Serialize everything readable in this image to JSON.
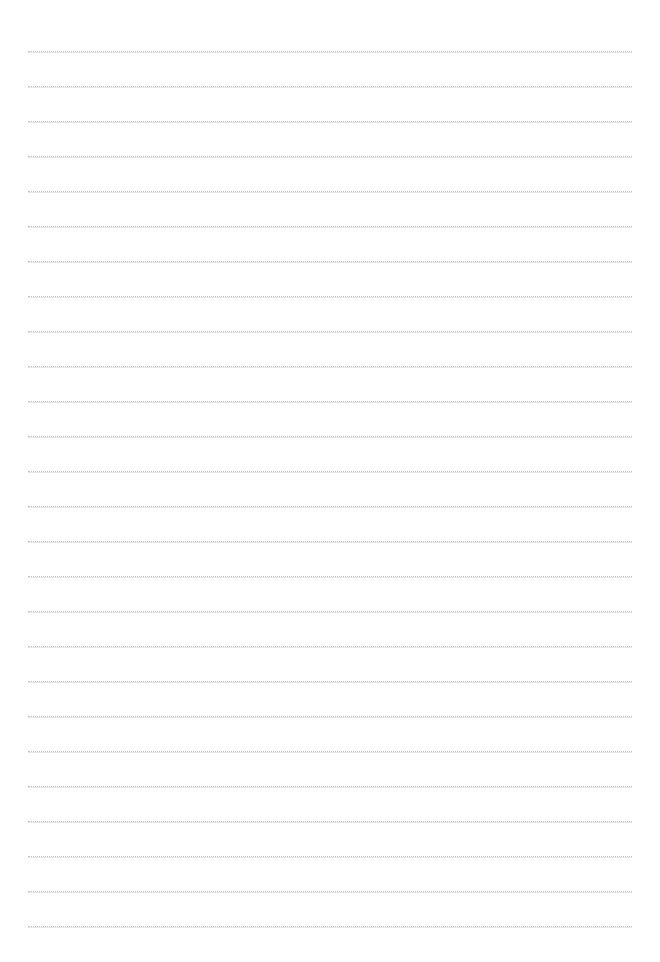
{
  "page": {
    "background_color": "#ffffff",
    "width": 660,
    "height": 962,
    "content_text": "",
    "page_number": ""
  },
  "ruling": {
    "style": "dotted",
    "line_color": "#c3c3c6",
    "line_thickness_px": 1,
    "line_count": 26,
    "first_line_y": 51,
    "line_spacing_px": 35,
    "left_margin_x": 28,
    "right_margin_x": 632,
    "line_length_px": 604,
    "lines": [
      {
        "index": 1,
        "y": 51,
        "text": ""
      },
      {
        "index": 2,
        "y": 86,
        "text": ""
      },
      {
        "index": 3,
        "y": 121,
        "text": ""
      },
      {
        "index": 4,
        "y": 156,
        "text": ""
      },
      {
        "index": 5,
        "y": 191,
        "text": ""
      },
      {
        "index": 6,
        "y": 226,
        "text": ""
      },
      {
        "index": 7,
        "y": 261,
        "text": ""
      },
      {
        "index": 8,
        "y": 296,
        "text": ""
      },
      {
        "index": 9,
        "y": 331,
        "text": ""
      },
      {
        "index": 10,
        "y": 366,
        "text": ""
      },
      {
        "index": 11,
        "y": 401,
        "text": ""
      },
      {
        "index": 12,
        "y": 436,
        "text": ""
      },
      {
        "index": 13,
        "y": 471,
        "text": ""
      },
      {
        "index": 14,
        "y": 506,
        "text": ""
      },
      {
        "index": 15,
        "y": 541,
        "text": ""
      },
      {
        "index": 16,
        "y": 576,
        "text": ""
      },
      {
        "index": 17,
        "y": 611,
        "text": ""
      },
      {
        "index": 18,
        "y": 646,
        "text": ""
      },
      {
        "index": 19,
        "y": 681,
        "text": ""
      },
      {
        "index": 20,
        "y": 716,
        "text": ""
      },
      {
        "index": 21,
        "y": 751,
        "text": ""
      },
      {
        "index": 22,
        "y": 786,
        "text": ""
      },
      {
        "index": 23,
        "y": 821,
        "text": ""
      },
      {
        "index": 24,
        "y": 856,
        "text": ""
      },
      {
        "index": 25,
        "y": 891,
        "text": ""
      },
      {
        "index": 26,
        "y": 926,
        "text": ""
      }
    ]
  }
}
